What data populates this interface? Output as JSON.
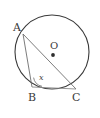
{
  "figure": {
    "type": "circle-geometry-diagram",
    "background_color": "#ffffff",
    "stroke_color": "#3a3a3a",
    "chord_color": "#6b6b6b",
    "circle": {
      "center_label": "O",
      "center_x": 52,
      "center_y": 52,
      "radius": 37
    },
    "points": [
      {
        "label": "A",
        "x": 23,
        "y": 34,
        "label_x": 13,
        "label_y": 31
      },
      {
        "label": "B",
        "x": 32,
        "y": 87,
        "label_x": 28,
        "label_y": 101
      },
      {
        "label": "C",
        "x": 76,
        "y": 89,
        "label_x": 72,
        "label_y": 101
      }
    ],
    "angle": {
      "label": "x",
      "at_vertex": "B",
      "label_x": 39,
      "label_y": 80
    },
    "segments": [
      {
        "name": "chord-ab",
        "from": "A",
        "to": "B"
      },
      {
        "name": "chord-ac",
        "from": "A",
        "to": "C"
      },
      {
        "name": "chord-bc",
        "from": "B",
        "to": "C"
      }
    ]
  }
}
